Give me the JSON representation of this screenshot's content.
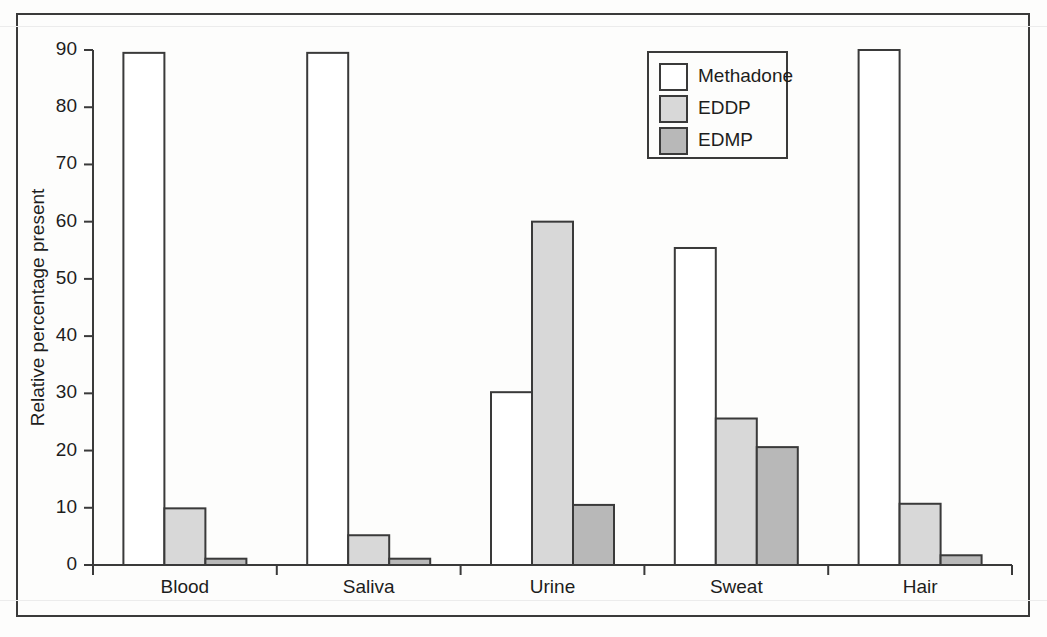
{
  "chart_data": {
    "type": "bar",
    "title": "",
    "subtitle": "",
    "xlabel": "",
    "ylabel": "Relative percentage present",
    "categories": [
      "Blood",
      "Saliva",
      "Urine",
      "Sweat",
      "Hair"
    ],
    "series": [
      {
        "name": "Methadone",
        "color": "#ffffff",
        "values": [
          89.5,
          89.5,
          30.2,
          55.4,
          90.0
        ]
      },
      {
        "name": "EDDP",
        "color": "#d8d8d8",
        "values": [
          9.9,
          5.2,
          60.0,
          25.6,
          10.7
        ]
      },
      {
        "name": "EDMP",
        "color": "#b8b8b8",
        "values": [
          1.1,
          1.1,
          10.5,
          20.6,
          1.7
        ]
      }
    ],
    "ylim": [
      0,
      90
    ],
    "yticks": [
      0,
      10,
      20,
      30,
      40,
      50,
      60,
      70,
      80,
      90
    ],
    "ytick_labels": [
      "0",
      "10",
      "20",
      "30",
      "40",
      "50",
      "60",
      "70",
      "80",
      "90"
    ],
    "grid": false,
    "legend_position": "top-right",
    "legend_entries": [
      "Methadone",
      "EDDP",
      "EDMP"
    ]
  },
  "figure": {
    "frame_color": "#3a3a3a",
    "background_color": "#fdfdfc",
    "axis_color": "#3a3a3a"
  }
}
